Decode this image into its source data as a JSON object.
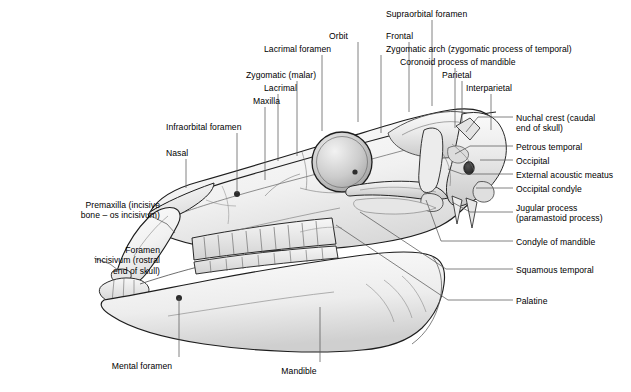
{
  "figure": {
    "view": "lateral (left side)",
    "colors": {
      "background": "#ffffff",
      "outline": "#1a1a1a",
      "leader_line": "#5a5a5a",
      "bone_light": "#f4f4f4",
      "bone_mid": "#dcdcdc",
      "bone_shadow": "#b4b4b4",
      "bone_dark": "#8f8f8f",
      "foramen_dark": "#3a3a3a",
      "text": "#000000"
    }
  },
  "labels": [
    {
      "id": "supraorbital-foramen",
      "text": "Supraorbital foramen",
      "align": "left",
      "x": 386,
      "y": 9,
      "leader": [
        [
          432,
          20
        ],
        [
          432,
          106
        ]
      ]
    },
    {
      "id": "orbit",
      "text": "Orbit",
      "align": "left",
      "x": 329,
      "y": 31,
      "leader": [
        [
          358,
          42
        ],
        [
          358,
          122
        ]
      ]
    },
    {
      "id": "frontal",
      "text": "Frontal",
      "align": "left",
      "x": 386,
      "y": 31,
      "leader": [
        [
          409,
          42
        ],
        [
          409,
          112
        ]
      ]
    },
    {
      "id": "zygomatic-arch",
      "text": "Zygomatic arch (zygomatic process of temporal)",
      "align": "left",
      "x": 386,
      "y": 44,
      "leader": [
        [
          381,
          55
        ],
        [
          381,
          133
        ]
      ]
    },
    {
      "id": "lacrimal-foramen",
      "text": "Lacrimal foramen",
      "align": "left",
      "x": 264,
      "y": 44,
      "leader": [
        [
          322,
          55
        ],
        [
          322,
          131
        ]
      ]
    },
    {
      "id": "coronoid-process",
      "text": "Coronoid process of mandible",
      "align": "left",
      "x": 400,
      "y": 57,
      "leader": [
        [
          455,
          68
        ],
        [
          455,
          128
        ]
      ]
    },
    {
      "id": "zygomatic-malar",
      "text": "Zygomatic (malar)",
      "align": "left",
      "x": 246,
      "y": 70,
      "leader": [
        [
          297,
          81
        ],
        [
          297,
          156
        ]
      ]
    },
    {
      "id": "parietal",
      "text": "Parietal",
      "align": "left",
      "x": 442,
      "y": 70,
      "leader": [
        [
          462,
          81
        ],
        [
          462,
          123
        ]
      ]
    },
    {
      "id": "lacrimal",
      "text": "Lacrimal",
      "align": "left",
      "x": 264,
      "y": 83,
      "leader": [
        [
          278,
          94
        ],
        [
          278,
          161
        ]
      ]
    },
    {
      "id": "interparietal",
      "text": "Interparietal",
      "align": "left",
      "x": 466,
      "y": 83,
      "leader": [
        [
          491,
          94
        ],
        [
          491,
          130
        ]
      ]
    },
    {
      "id": "maxilla",
      "text": "Maxilla",
      "align": "left",
      "x": 253,
      "y": 96,
      "leader": [
        [
          265,
          107
        ],
        [
          265,
          180
        ]
      ]
    },
    {
      "id": "infraorbital-foramen",
      "text": "Infraorbital foramen",
      "align": "left",
      "x": 166,
      "y": 122,
      "leader": [
        [
          237,
          133
        ],
        [
          237,
          193
        ]
      ]
    },
    {
      "id": "nasal",
      "text": "Nasal",
      "align": "left",
      "x": 166,
      "y": 148,
      "leader": [
        [
          186,
          159
        ],
        [
          186,
          188
        ]
      ]
    },
    {
      "id": "nuchal-crest",
      "text": "Nuchal crest (caudal\nend of skull)",
      "align": "left",
      "x": 516,
      "y": 113,
      "leader": [
        [
          513,
          117
        ],
        [
          478,
          117
        ],
        [
          466,
          132
        ]
      ]
    },
    {
      "id": "petrous-temporal",
      "text": "Petrous temporal",
      "align": "left",
      "x": 516,
      "y": 142,
      "leader": [
        [
          513,
          146
        ],
        [
          470,
          146
        ],
        [
          455,
          154
        ]
      ]
    },
    {
      "id": "occipital",
      "text": "Occipital",
      "align": "left",
      "x": 516,
      "y": 156,
      "leader": [
        [
          513,
          160
        ],
        [
          488,
          160
        ],
        [
          480,
          160
        ]
      ]
    },
    {
      "id": "external-acoustic-meatus",
      "text": "External acoustic meatus",
      "align": "left",
      "x": 516,
      "y": 170,
      "leader": [
        [
          513,
          174
        ],
        [
          462,
          174
        ],
        [
          448,
          169
        ]
      ]
    },
    {
      "id": "occipital-condyle",
      "text": "Occipital condyle",
      "align": "left",
      "x": 516,
      "y": 184,
      "leader": [
        [
          513,
          188
        ],
        [
          483,
          188
        ],
        [
          476,
          188
        ]
      ]
    },
    {
      "id": "jugular-process",
      "text": "Jugular process\n(paramastoid process)",
      "align": "left",
      "x": 516,
      "y": 203,
      "leader": [
        [
          513,
          212
        ],
        [
          470,
          212
        ],
        [
          452,
          202
        ]
      ]
    },
    {
      "id": "condyle-of-mandible",
      "text": "Condyle of mandible",
      "align": "left",
      "x": 516,
      "y": 237,
      "leader": [
        [
          513,
          241
        ],
        [
          441,
          241
        ],
        [
          426,
          200
        ]
      ]
    },
    {
      "id": "squamous-temporal",
      "text": "Squamous temporal",
      "align": "left",
      "x": 516,
      "y": 265,
      "leader": [
        [
          513,
          269
        ],
        [
          446,
          269
        ],
        [
          360,
          212
        ]
      ]
    },
    {
      "id": "palatine",
      "text": "Palatine",
      "align": "left",
      "x": 516,
      "y": 296,
      "leader": [
        [
          513,
          300
        ],
        [
          448,
          300
        ],
        [
          336,
          225
        ]
      ]
    },
    {
      "id": "premaxilla",
      "text": "Premaxilla (incisive\nbone – os incisivum)",
      "align": "right",
      "x": 30,
      "y": 200,
      "leader": [
        [
          147,
          214
        ],
        [
          167,
          224
        ],
        [
          175,
          233
        ]
      ]
    },
    {
      "id": "foramen-incisivum",
      "text": "Foramen\nincisivum (rostral\nend of skull)",
      "align": "right",
      "x": 30,
      "y": 245,
      "leader": [
        [
          94,
          258
        ],
        [
          110,
          264
        ],
        [
          118,
          270
        ]
      ]
    },
    {
      "id": "mental-foramen",
      "text": "Mental foramen",
      "align": "center",
      "x": 142,
      "y": 361,
      "leader": [
        [
          179,
          357
        ],
        [
          179,
          298
        ]
      ]
    },
    {
      "id": "mandible",
      "text": "Mandible",
      "align": "center",
      "x": 299,
      "y": 366,
      "leader": [
        [
          320,
          362
        ],
        [
          320,
          307
        ]
      ]
    }
  ]
}
